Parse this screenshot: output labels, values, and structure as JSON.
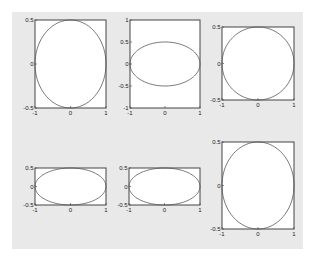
{
  "chart_data": [
    {
      "type": "line",
      "title": "",
      "description": "ellipse x=cos(t), y=0.5*sin(t)",
      "xlim": [
        -1,
        1
      ],
      "ylim": [
        -0.5,
        0.5
      ],
      "xticks": [
        "-1",
        "0",
        "1"
      ],
      "yticks": [
        "-0.5",
        "0",
        "0.5"
      ],
      "xtick_values": [
        -1,
        0,
        1
      ],
      "ytick_values": [
        -0.5,
        0,
        0.5
      ],
      "ellipse": {
        "rx": 1,
        "ry": 0.5
      }
    },
    {
      "type": "line",
      "title": "",
      "description": "ellipse x=cos(t), y=0.5*sin(t)",
      "xlim": [
        -1,
        1
      ],
      "ylim": [
        -1,
        1
      ],
      "xticks": [
        "-1",
        "0",
        "1"
      ],
      "yticks": [
        "-1",
        "-0.5",
        "0",
        "0.5",
        "1"
      ],
      "xtick_values": [
        -1,
        0,
        1
      ],
      "ytick_values": [
        -1,
        -0.5,
        0,
        0.5,
        1
      ],
      "ellipse": {
        "rx": 1,
        "ry": 0.5
      }
    },
    {
      "type": "line",
      "title": "",
      "description": "ellipse x=cos(t), y=0.5*sin(t)",
      "xlim": [
        -1,
        1
      ],
      "ylim": [
        -0.5,
        0.5
      ],
      "xticks": [
        "-1",
        "0",
        "1"
      ],
      "yticks": [
        "-0.5",
        "0",
        "0.5"
      ],
      "xtick_values": [
        -1,
        0,
        1
      ],
      "ytick_values": [
        -0.5,
        0,
        0.5
      ],
      "ellipse": {
        "rx": 1,
        "ry": 0.5
      }
    },
    {
      "type": "line",
      "title": "",
      "description": "ellipse x=cos(t), y=0.5*sin(t)",
      "xlim": [
        -1,
        1
      ],
      "ylim": [
        -0.5,
        0.5
      ],
      "xticks": [
        "-1",
        "0",
        "1"
      ],
      "yticks": [
        "-0.5",
        "0",
        "0.5"
      ],
      "xtick_values": [
        -1,
        0,
        1
      ],
      "ytick_values": [
        -0.5,
        0,
        0.5
      ],
      "ellipse": {
        "rx": 1,
        "ry": 0.5
      }
    },
    {
      "type": "line",
      "title": "",
      "description": "ellipse x=cos(t), y=0.5*sin(t)",
      "xlim": [
        -1,
        1
      ],
      "ylim": [
        -0.5,
        0.5
      ],
      "xticks": [
        "-1",
        "0",
        "1"
      ],
      "yticks": [
        "-0.5",
        "0",
        "0.5"
      ],
      "xtick_values": [
        -1,
        0,
        1
      ],
      "ytick_values": [
        -0.5,
        0,
        0.5
      ],
      "ellipse": {
        "rx": 1,
        "ry": 0.5
      }
    },
    {
      "type": "line",
      "title": "",
      "description": "ellipse x=cos(t), y=0.5*sin(t)",
      "xlim": [
        -1,
        1
      ],
      "ylim": [
        -0.5,
        0.5
      ],
      "xticks": [
        "-1",
        "0",
        "1"
      ],
      "yticks": [
        "-0.5",
        "0",
        "0.5"
      ],
      "xtick_values": [
        -1,
        0,
        1
      ],
      "ytick_values": [
        -0.5,
        0,
        0.5
      ],
      "ellipse": {
        "rx": 1,
        "ry": 0.5
      }
    }
  ],
  "colors": {
    "figure_bg": "#e9e9e9",
    "axes_bg": "#ffffff",
    "axes_edge": "#444444",
    "line": "#555555"
  }
}
